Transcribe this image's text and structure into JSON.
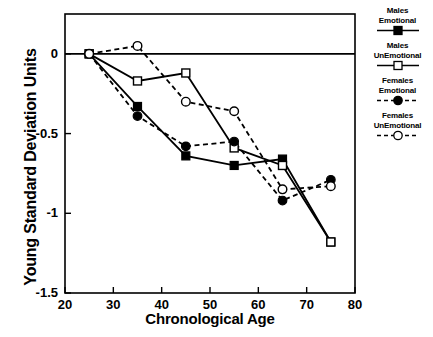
{
  "chart_data": {
    "type": "line",
    "title": "",
    "xlabel": "Chronological Age",
    "ylabel": "Young Standard Deviation Units",
    "xlim": [
      20,
      80
    ],
    "ylim": [
      -1.5,
      0.25
    ],
    "xticks": [
      20,
      30,
      40,
      50,
      60,
      70,
      80
    ],
    "yticks": [
      0,
      -0.5,
      -1,
      -1.5
    ],
    "ytick_labels": [
      "0",
      "-0.5",
      "-1",
      "-1.5"
    ],
    "xtick_labels": [
      "20",
      "30",
      "40",
      "50",
      "60",
      "70",
      "80"
    ],
    "grid": false,
    "legend_position": "right",
    "reference_line_y": 0,
    "x": [
      25,
      35,
      45,
      55,
      65,
      75
    ],
    "series": [
      {
        "name": "Males Emotional",
        "label_line1": "Males",
        "label_line2": "Emotional",
        "marker": "filled-square",
        "linestyle": "solid",
        "color": "#000000",
        "values": [
          0.0,
          -0.33,
          -0.64,
          -0.7,
          -0.66,
          -1.18
        ]
      },
      {
        "name": "Males UnEmotional",
        "label_line1": "Males",
        "label_line2": "UnEmotional",
        "marker": "open-square",
        "linestyle": "solid",
        "color": "#000000",
        "values": [
          0.0,
          -0.17,
          -0.12,
          -0.59,
          -0.7,
          -1.18
        ]
      },
      {
        "name": "Females Emotional",
        "label_line1": "Females",
        "label_line2": "Emotional",
        "marker": "filled-circle",
        "linestyle": "dashed",
        "color": "#000000",
        "values": [
          0.0,
          -0.39,
          -0.58,
          -0.55,
          -0.92,
          -0.79
        ]
      },
      {
        "name": "Females UnEmotional",
        "label_line1": "Females",
        "label_line2": "UnEmotional",
        "marker": "open-circle",
        "linestyle": "dashed",
        "color": "#000000",
        "values": [
          0.0,
          0.05,
          -0.3,
          -0.36,
          -0.85,
          -0.83
        ]
      }
    ]
  },
  "axes": {
    "xlabel": "Chronological Age",
    "ylabel": "Young Standard Deviation Units"
  },
  "legend": {
    "entries": [
      {
        "line1": "Males",
        "line2": "Emotional"
      },
      {
        "line1": "Males",
        "line2": "UnEmotional"
      },
      {
        "line1": "Females",
        "line2": "Emotional"
      },
      {
        "line1": "Females",
        "line2": "UnEmotional"
      }
    ]
  }
}
